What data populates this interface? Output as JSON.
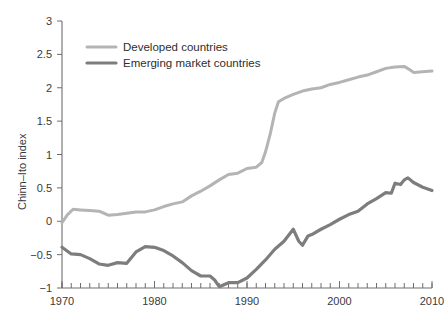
{
  "chart_data": {
    "type": "line",
    "title": "",
    "xlabel": "",
    "ylabel": "Chinn–Ito index",
    "xlim": [
      1970,
      2010
    ],
    "ylim": [
      -1,
      3
    ],
    "ytick_labels": [
      "3",
      "2.5",
      "2",
      "1.5",
      "1",
      "0.5",
      "0",
      "−0.5",
      "−1"
    ],
    "ytick_values": [
      3,
      2.5,
      2,
      1.5,
      1,
      0.5,
      0,
      -0.5,
      -1
    ],
    "xtick_labels": [
      "1970",
      "1980",
      "1990",
      "2000",
      "2010"
    ],
    "xtick_values": [
      1970,
      1980,
      1990,
      2000,
      2010
    ],
    "minor_xtick_step": 1,
    "grid": false,
    "legend_position": "top-left-inside",
    "x": [
      1970,
      1971,
      1972,
      1973,
      1974,
      1975,
      1976,
      1977,
      1978,
      1979,
      1980,
      1981,
      1982,
      1983,
      1984,
      1985,
      1986,
      1987,
      1988,
      1989,
      1990,
      1991,
      1992,
      1993,
      1994,
      1995,
      1996,
      1997,
      1998,
      1999,
      2000,
      2001,
      2002,
      2003,
      2004,
      2005,
      2006,
      2007,
      2008,
      2009,
      2010
    ],
    "series": [
      {
        "name": "Developed countries",
        "color": "#b4b4b4",
        "width": 3.0,
        "values": [
          -0.02,
          0.13,
          0.18,
          0.17,
          0.15,
          0.14,
          0.09,
          0.1,
          0.13,
          0.14,
          0.14,
          0.16,
          0.2,
          0.24,
          0.29,
          0.36,
          0.44,
          0.52,
          0.58,
          0.66,
          0.7,
          0.73,
          0.76,
          0.8,
          0.8,
          0.82,
          0.98,
          1.12,
          1.34,
          1.56,
          1.79,
          1.87,
          1.92,
          1.97,
          2.02,
          2.07,
          2.12,
          2.16,
          2.2,
          2.24,
          2.27
        ]
      },
      {
        "name": "Emerging market countries",
        "color": "#7d7d7d",
        "width": 3.2,
        "values": [
          -0.39,
          -0.46,
          -0.49,
          -0.51,
          -0.58,
          -0.65,
          -0.63,
          -0.62,
          -0.62,
          -0.48,
          -0.39,
          -0.39,
          -0.41,
          -0.46,
          -0.54,
          -0.63,
          -0.72,
          -0.79,
          -0.8,
          -0.86,
          -0.98,
          -0.92,
          -0.91,
          -0.9,
          -0.83,
          -0.7,
          -0.56,
          -0.42,
          -0.3,
          -0.12,
          -0.36,
          -0.28,
          -0.21,
          -0.14,
          -0.06,
          0.02,
          0.08,
          0.15,
          0.21,
          0.24,
          0.3
        ]
      }
    ],
    "series_note": "The drawn curve is rendered from the detailed point list below which follows the digitised trace of the figure.",
    "traced": {
      "developed": [
        [
          1970.0,
          -0.02
        ],
        [
          1970.6,
          0.1
        ],
        [
          1971.2,
          0.18
        ],
        [
          1972.0,
          0.17
        ],
        [
          1973.0,
          0.16
        ],
        [
          1974.0,
          0.15
        ],
        [
          1975.0,
          0.09
        ],
        [
          1976.0,
          0.1
        ],
        [
          1977.0,
          0.12
        ],
        [
          1978.0,
          0.14
        ],
        [
          1979.0,
          0.14
        ],
        [
          1980.0,
          0.17
        ],
        [
          1981.0,
          0.22
        ],
        [
          1982.0,
          0.26
        ],
        [
          1983.0,
          0.29
        ],
        [
          1984.0,
          0.38
        ],
        [
          1985.0,
          0.45
        ],
        [
          1986.0,
          0.53
        ],
        [
          1987.0,
          0.62
        ],
        [
          1988.0,
          0.7
        ],
        [
          1989.0,
          0.72
        ],
        [
          1990.0,
          0.79
        ],
        [
          1991.0,
          0.81
        ],
        [
          1991.6,
          0.88
        ],
        [
          1992.0,
          1.04
        ],
        [
          1992.5,
          1.3
        ],
        [
          1993.0,
          1.62
        ],
        [
          1993.4,
          1.79
        ],
        [
          1994.0,
          1.84
        ],
        [
          1995.0,
          1.9
        ],
        [
          1996.0,
          1.95
        ],
        [
          1997.0,
          1.98
        ],
        [
          1998.0,
          2.0
        ],
        [
          1999.0,
          2.05
        ],
        [
          2000.0,
          2.08
        ],
        [
          2001.0,
          2.12
        ],
        [
          2002.0,
          2.16
        ],
        [
          2003.0,
          2.19
        ],
        [
          2004.0,
          2.24
        ],
        [
          2005.0,
          2.29
        ],
        [
          2006.0,
          2.31
        ],
        [
          2007.0,
          2.32
        ],
        [
          2007.6,
          2.27
        ],
        [
          2008.0,
          2.23
        ],
        [
          2009.0,
          2.24
        ],
        [
          2010.0,
          2.25
        ]
      ],
      "emerging": [
        [
          1970.0,
          -0.39
        ],
        [
          1971.0,
          -0.49
        ],
        [
          1972.0,
          -0.5
        ],
        [
          1973.0,
          -0.56
        ],
        [
          1974.0,
          -0.64
        ],
        [
          1975.0,
          -0.66
        ],
        [
          1976.0,
          -0.62
        ],
        [
          1977.0,
          -0.63
        ],
        [
          1978.0,
          -0.46
        ],
        [
          1979.0,
          -0.38
        ],
        [
          1980.0,
          -0.39
        ],
        [
          1981.0,
          -0.44
        ],
        [
          1982.0,
          -0.52
        ],
        [
          1983.0,
          -0.62
        ],
        [
          1984.0,
          -0.74
        ],
        [
          1985.0,
          -0.82
        ],
        [
          1986.0,
          -0.82
        ],
        [
          1986.5,
          -0.88
        ],
        [
          1987.0,
          -0.98
        ],
        [
          1988.0,
          -0.92
        ],
        [
          1989.0,
          -0.92
        ],
        [
          1990.0,
          -0.85
        ],
        [
          1991.0,
          -0.72
        ],
        [
          1992.0,
          -0.58
        ],
        [
          1993.0,
          -0.42
        ],
        [
          1994.0,
          -0.3
        ],
        [
          1995.0,
          -0.12
        ],
        [
          1995.6,
          -0.3
        ],
        [
          1996.0,
          -0.36
        ],
        [
          1996.6,
          -0.22
        ],
        [
          1997.0,
          -0.2
        ],
        [
          1998.0,
          -0.12
        ],
        [
          1999.0,
          -0.05
        ],
        [
          2000.0,
          0.03
        ],
        [
          2001.0,
          0.1
        ],
        [
          2002.0,
          0.15
        ],
        [
          2003.0,
          0.26
        ],
        [
          2004.0,
          0.34
        ],
        [
          2005.0,
          0.43
        ],
        [
          2005.6,
          0.42
        ],
        [
          2006.0,
          0.57
        ],
        [
          2006.6,
          0.55
        ],
        [
          2007.0,
          0.62
        ],
        [
          2007.4,
          0.65
        ],
        [
          2008.0,
          0.58
        ],
        [
          2009.0,
          0.51
        ],
        [
          2010.0,
          0.46
        ]
      ]
    }
  },
  "legend": {
    "items": [
      {
        "label": "Developed countries"
      },
      {
        "label": "Emerging market countries"
      }
    ]
  }
}
